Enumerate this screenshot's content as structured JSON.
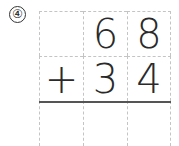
{
  "problem_number": "④",
  "problem": {
    "type": "vertical-addition",
    "operator": "+",
    "rows": [
      [
        "",
        "6",
        "8"
      ],
      [
        "+",
        "3",
        "4"
      ],
      [
        "",
        "",
        ""
      ]
    ]
  },
  "colors": {
    "grid": "#c4c4c4",
    "ink": "#2a2a2a",
    "rule": "#555555"
  }
}
